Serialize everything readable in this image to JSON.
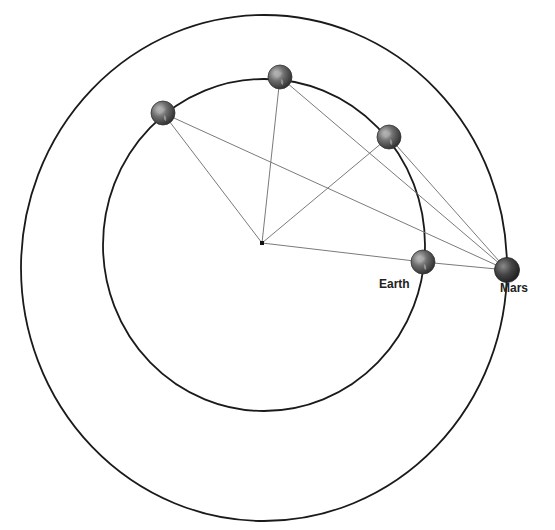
{
  "diagram": {
    "sun": {
      "x": 262,
      "y": 243
    },
    "earth_orbit": {
      "cx": 264,
      "cy": 245,
      "rx": 161,
      "ry": 166
    },
    "mars_orbit": {
      "cx": 264,
      "cy": 268,
      "rx": 243,
      "ry": 253
    },
    "earth_positions": [
      {
        "x": 163,
        "y": 113
      },
      {
        "x": 280,
        "y": 77
      },
      {
        "x": 389,
        "y": 137
      },
      {
        "x": 423,
        "y": 262
      }
    ],
    "mars_position": {
      "x": 507,
      "y": 270
    },
    "labels": {
      "earth": "Earth",
      "mars": "Mars"
    },
    "colors": {
      "orbit": "#1a1a1a",
      "sight_line": "#7a7a7a",
      "earth": "#6b6b6b",
      "mars": "#3a3a3a"
    }
  }
}
